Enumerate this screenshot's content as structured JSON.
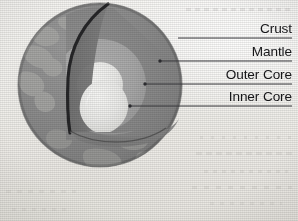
{
  "figure": {
    "background_color": "#f2f1ee"
  },
  "labels": [
    {
      "id": "crust",
      "text": "Crust",
      "leader_from": [
        178,
        38
      ],
      "leader_to": [
        292,
        38
      ],
      "color": "#17171a"
    },
    {
      "id": "mantle",
      "text": "Mantle",
      "leader_from": [
        160,
        61
      ],
      "leader_to": [
        292,
        61
      ],
      "color": "#17171a"
    },
    {
      "id": "outer_core",
      "text": "Outer Core",
      "leader_from": [
        145,
        84
      ],
      "leader_to": [
        292,
        84
      ],
      "color": "#17171a"
    },
    {
      "id": "inner_core",
      "text": "Inner Core",
      "leader_from": [
        130,
        106
      ],
      "leader_to": [
        292,
        106
      ],
      "color": "#17171a"
    }
  ],
  "layers": {
    "surface": {
      "name": "Surface",
      "color": "#8e8e8e"
    },
    "continents": {
      "name": "Continents",
      "color": "#a9a9a7"
    },
    "crust": {
      "name": "Crust",
      "color": "#262628"
    },
    "mantle": {
      "name": "Mantle",
      "color": "#8a8a8a"
    },
    "mantle_cut": {
      "name": "Mantle cut face",
      "color": "#7c7c7c"
    },
    "outer_core": {
      "name": "Outer Core",
      "color": "#a8a8a8"
    },
    "inner_core": {
      "name": "Inner Core",
      "color": "#ebebe9"
    },
    "leader_line": {
      "name": "Leader line",
      "color": "#3a3a3e"
    }
  },
  "geometry": {
    "sphere_center": [
      100,
      85
    ],
    "sphere_radius": 82,
    "cut_apex": [
      108,
      5
    ]
  }
}
